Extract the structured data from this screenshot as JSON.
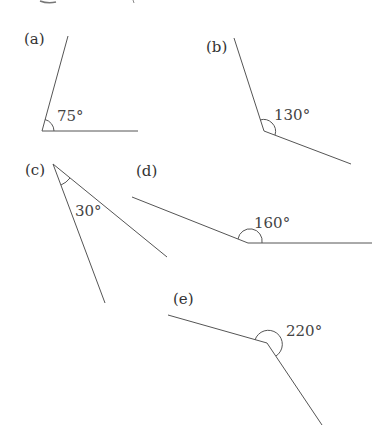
{
  "figure": {
    "colors": {
      "line": "#555555",
      "text": "#333333",
      "background": "#ffffff"
    },
    "angles": [
      {
        "id": "a",
        "label": "(a)",
        "value": "75°"
      },
      {
        "id": "b",
        "label": "(b)",
        "value": "130°"
      },
      {
        "id": "c",
        "label": "(c)",
        "value": "30°"
      },
      {
        "id": "d",
        "label": "(d)",
        "value": "160°"
      },
      {
        "id": "e",
        "label": "(e)",
        "value": "220°"
      }
    ]
  }
}
